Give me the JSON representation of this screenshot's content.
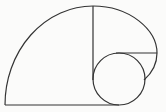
{
  "diagram": {
    "type": "golden-spiral-construction",
    "stroke_color": "#333333",
    "background_color": "#fbfbfa",
    "elements": [
      {
        "name": "baseline",
        "kind": "line",
        "x1": 5,
        "y1": 105,
        "x2": 119,
        "y2": 105
      },
      {
        "name": "outer-arc",
        "kind": "arc",
        "from": [
          5,
          105
        ],
        "to": [
          93,
          6
        ]
      },
      {
        "name": "vertical-divider",
        "kind": "line",
        "x1": 93,
        "y1": 6,
        "x2": 93,
        "y2": 80
      },
      {
        "name": "right-arc",
        "kind": "arc",
        "from": [
          93,
          6
        ],
        "to": [
          144,
          80
        ]
      },
      {
        "name": "horizontal-divider",
        "kind": "line",
        "x1": 116,
        "y1": 53,
        "x2": 157,
        "y2": 53
      },
      {
        "name": "inner-circle",
        "kind": "circle",
        "cx": 119,
        "cy": 79,
        "r": 26
      }
    ]
  }
}
